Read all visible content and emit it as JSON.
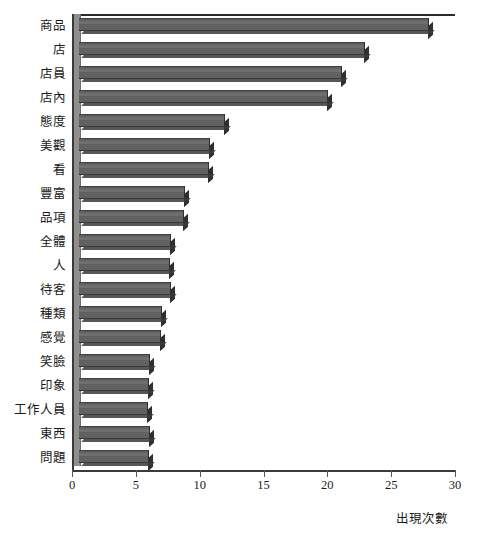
{
  "chart_data": {
    "type": "bar",
    "orientation": "horizontal",
    "title": "",
    "xlabel": "出現次數",
    "ylabel": "",
    "xlim": [
      0,
      30
    ],
    "xticks": [
      0,
      5,
      10,
      15,
      20,
      25,
      30
    ],
    "xtick_labels": [
      "0",
      "5",
      "10",
      "15",
      "20",
      "25",
      "30"
    ],
    "grid": false,
    "style": "3d-bar",
    "bar_color": "#616161",
    "axis_color": "#3a3a3a",
    "categories": [
      "商品",
      "店",
      "店員",
      "店內",
      "態度",
      "美觀",
      "看",
      "豐富",
      "品項",
      "全體",
      "人",
      "待客",
      "種類",
      "感覺",
      "笑臉",
      "印象",
      "工作人員",
      "東西",
      "問題"
    ],
    "values": [
      27.4,
      22.4,
      20.6,
      19.5,
      11.4,
      10.3,
      10.2,
      8.3,
      8.2,
      7.2,
      7.1,
      7.2,
      6.5,
      6.4,
      5.6,
      5.5,
      5.4,
      5.6,
      5.5
    ]
  }
}
